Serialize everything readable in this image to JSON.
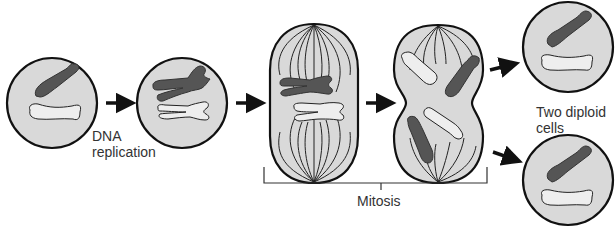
{
  "diagram": {
    "labels": {
      "dna_replication_line1": "DNA",
      "dna_replication_line2": "replication",
      "mitosis": "Mitosis",
      "daughters_line1": "Two diploid",
      "daughters_line2": "cells"
    },
    "stages": [
      {
        "id": "parent-cell",
        "description": "Diploid cell with two unreplicated chromosomes"
      },
      {
        "id": "replicated-cell",
        "description": "Cell after DNA replication with sister chromatids"
      },
      {
        "id": "metaphase-cell",
        "description": "Chromosomes aligned at the metaphase plate with spindle fibers"
      },
      {
        "id": "anaphase-cell",
        "description": "Sister chromatids separating to opposite poles"
      },
      {
        "id": "daughter-cell-top",
        "description": "Diploid daughter cell"
      },
      {
        "id": "daughter-cell-bottom",
        "description": "Diploid daughter cell"
      }
    ],
    "colors": {
      "cell_fill": "#d9d9d9",
      "cell_outline": "#111111",
      "dark_chromosome": "#555555",
      "light_chromosome": "#eeeeee",
      "arrow": "#111111",
      "text": "#333333"
    }
  }
}
